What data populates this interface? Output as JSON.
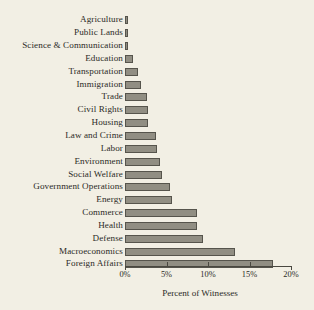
{
  "chart_data": {
    "type": "bar",
    "orientation": "horizontal",
    "title": "",
    "xlabel": "Percent of Witnesses",
    "ylabel": "",
    "xlim": [
      0,
      20
    ],
    "xticks": [
      0,
      5,
      10,
      15,
      20
    ],
    "xtick_labels": [
      "0%",
      "5%",
      "10%",
      "15%",
      "20%"
    ],
    "grid": false,
    "legend": null,
    "unit": "%",
    "categories": [
      "Agriculture",
      "Public Lands",
      "Science & Communication",
      "Education",
      "Transportation",
      "Immigration",
      "Trade",
      "Civil Rights",
      "Housing",
      "Law and Crime",
      "Labor",
      "Environment",
      "Social Welfare",
      "Government Operations",
      "Energy",
      "Commerce",
      "Health",
      "Defense",
      "Macroeconomics",
      "Foreign Affairs"
    ],
    "values": [
      0.35,
      0.35,
      0.35,
      1.0,
      1.6,
      1.9,
      2.6,
      2.8,
      2.8,
      3.7,
      3.8,
      4.2,
      4.4,
      5.4,
      5.7,
      8.7,
      8.7,
      9.4,
      13.3,
      17.8
    ],
    "colors": {
      "background": "#f2efe4",
      "bar_fill": "#918e83",
      "bar_edge": "#56544c",
      "axis": "#4a4840",
      "text": "#2b2a26"
    }
  }
}
